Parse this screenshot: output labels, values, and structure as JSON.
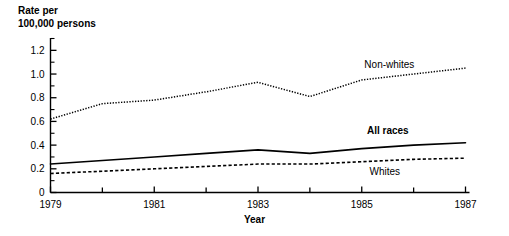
{
  "chart_data": {
    "type": "line",
    "title": "",
    "ylabel": "Rate per\n100,000 persons",
    "xlabel": "Year",
    "x": [
      1979,
      1980,
      1981,
      1982,
      1983,
      1984,
      1985,
      1986,
      1987
    ],
    "xlim": [
      1979,
      1987
    ],
    "ylim": [
      0,
      1.3
    ],
    "grid": false,
    "legend_position": "inline-annotations",
    "xtick_labels": [
      "1979",
      "1981",
      "1983",
      "1985",
      "1987"
    ],
    "xtick_values": [
      1979,
      1981,
      1983,
      1985,
      1987
    ],
    "xminor_tick_values": [
      1980,
      1982,
      1984,
      1986
    ],
    "ytick_labels": [
      "0",
      "0.2",
      "0.4",
      "0.6",
      "0.8",
      "1.0",
      "1.2"
    ],
    "ytick_values": [
      0,
      0.2,
      0.4,
      0.6,
      0.8,
      1.0,
      1.2
    ],
    "yminor_tick_values": [
      0.1,
      0.3,
      0.5,
      0.7,
      0.9,
      1.1,
      1.3
    ],
    "series": [
      {
        "name": "Non-whites",
        "style": "dotted",
        "color": "#000000",
        "values": [
          0.62,
          0.75,
          0.78,
          0.85,
          0.93,
          0.81,
          0.95,
          1.0,
          1.05
        ]
      },
      {
        "name": "All races",
        "style": "solid",
        "color": "#000000",
        "values": [
          0.24,
          0.27,
          0.3,
          0.33,
          0.36,
          0.33,
          0.37,
          0.4,
          0.42
        ]
      },
      {
        "name": "Whites",
        "style": "dashed",
        "color": "#000000",
        "values": [
          0.16,
          0.18,
          0.2,
          0.22,
          0.24,
          0.24,
          0.26,
          0.28,
          0.29
        ]
      }
    ],
    "annotations": [
      {
        "text": "Non-whites",
        "x": 1985.05,
        "y": 1.075,
        "bold": false
      },
      {
        "text": "All races",
        "x": 1985.1,
        "y": 0.52,
        "bold": true
      },
      {
        "text": "Whites",
        "x": 1985.15,
        "y": 0.175,
        "bold": false
      }
    ]
  },
  "axis": {
    "y_title": "Rate per\n100,000 persons",
    "x_title": "Year"
  }
}
